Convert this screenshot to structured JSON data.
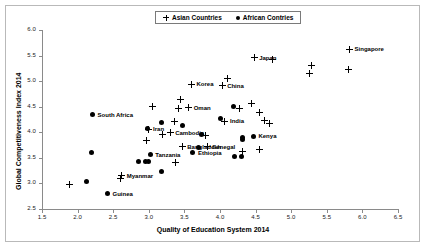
{
  "chart_data": {
    "type": "scatter",
    "title": "",
    "xlabel": "Quality of Education System 2014",
    "ylabel": "Global Competitiveness Index 2014",
    "xlim": [
      1.5,
      6.5
    ],
    "ylim": [
      2.5,
      6.0
    ],
    "xticks": [
      "1.5",
      "2.0",
      "2.5",
      "3.0",
      "3.5",
      "4.0",
      "4.5",
      "5.0",
      "5.5",
      "6.0",
      "6.5"
    ],
    "yticks": [
      "2.5",
      "3.0",
      "3.5",
      "4.0",
      "4.5",
      "5.0",
      "5.5",
      "6.0"
    ],
    "grid": false,
    "legend_position": "top-center",
    "legend": [
      {
        "label": "Asian Countries",
        "marker": "plus"
      },
      {
        "label": "African Contries",
        "marker": "dot"
      }
    ],
    "series": [
      {
        "name": "Asian Countries",
        "marker": "plus",
        "points": [
          {
            "x": 1.89,
            "y": 2.97,
            "label": ""
          },
          {
            "x": 2.6,
            "y": 3.09,
            "label": ""
          },
          {
            "x": 2.62,
            "y": 3.15,
            "label": "Myanmar",
            "label_side": "right"
          },
          {
            "x": 2.97,
            "y": 3.83,
            "label": ""
          },
          {
            "x": 2.99,
            "y": 4.06,
            "label": "Iran",
            "label_side": "right"
          },
          {
            "x": 3.05,
            "y": 4.51,
            "label": ""
          },
          {
            "x": 3.19,
            "y": 3.96,
            "label": ""
          },
          {
            "x": 3.3,
            "y": 3.99,
            "label": "Cambodia",
            "label_side": "right"
          },
          {
            "x": 3.36,
            "y": 4.22,
            "label": ""
          },
          {
            "x": 3.38,
            "y": 3.41,
            "label": ""
          },
          {
            "x": 3.42,
            "y": 4.47,
            "label": ""
          },
          {
            "x": 3.44,
            "y": 4.65,
            "label": ""
          },
          {
            "x": 3.47,
            "y": 3.72,
            "label": "Bangladesh",
            "label_side": "right"
          },
          {
            "x": 3.56,
            "y": 4.48,
            "label": "Oman",
            "label_side": "right"
          },
          {
            "x": 3.6,
            "y": 4.94,
            "label": "Korea",
            "label_side": "right"
          },
          {
            "x": 3.8,
            "y": 3.94,
            "label": ""
          },
          {
            "x": 3.82,
            "y": 3.72,
            "label": "Senegal",
            "label_side": "right"
          },
          {
            "x": 4.03,
            "y": 4.91,
            "label": "China",
            "label_side": "right"
          },
          {
            "x": 4.07,
            "y": 4.22,
            "label": "India",
            "label_side": "right"
          },
          {
            "x": 4.1,
            "y": 5.06,
            "label": ""
          },
          {
            "x": 4.28,
            "y": 4.46,
            "label": ""
          },
          {
            "x": 4.32,
            "y": 3.62,
            "label": ""
          },
          {
            "x": 4.44,
            "y": 4.57,
            "label": ""
          },
          {
            "x": 4.48,
            "y": 5.46,
            "label": "Japan",
            "label_side": "right"
          },
          {
            "x": 4.55,
            "y": 4.39,
            "label": ""
          },
          {
            "x": 4.56,
            "y": 3.67,
            "label": ""
          },
          {
            "x": 4.62,
            "y": 4.24,
            "label": ""
          },
          {
            "x": 4.7,
            "y": 4.18,
            "label": ""
          },
          {
            "x": 4.74,
            "y": 5.43,
            "label": ""
          },
          {
            "x": 5.26,
            "y": 5.15,
            "label": ""
          },
          {
            "x": 5.28,
            "y": 5.31,
            "label": ""
          },
          {
            "x": 5.8,
            "y": 5.23,
            "label": ""
          },
          {
            "x": 5.82,
            "y": 5.62,
            "label": "Singapore",
            "label_side": "right"
          }
        ]
      },
      {
        "name": "African Contries",
        "marker": "dot",
        "points": [
          {
            "x": 2.13,
            "y": 3.04,
            "label": ""
          },
          {
            "x": 2.19,
            "y": 3.6,
            "label": ""
          },
          {
            "x": 2.21,
            "y": 4.34,
            "label": "South Africa",
            "label_side": "right"
          },
          {
            "x": 2.42,
            "y": 2.8,
            "label": "Guinea",
            "label_side": "right"
          },
          {
            "x": 2.85,
            "y": 3.43,
            "label": ""
          },
          {
            "x": 2.96,
            "y": 3.42,
            "label": ""
          },
          {
            "x": 2.99,
            "y": 3.42,
            "label": ""
          },
          {
            "x": 2.98,
            "y": 4.07,
            "label": ""
          },
          {
            "x": 3.02,
            "y": 3.56,
            "label": "Tanzania",
            "label_side": "right"
          },
          {
            "x": 3.18,
            "y": 4.2,
            "label": ""
          },
          {
            "x": 3.18,
            "y": 3.24,
            "label": ""
          },
          {
            "x": 3.47,
            "y": 4.13,
            "label": ""
          },
          {
            "x": 3.62,
            "y": 3.6,
            "label": "Ethiopia",
            "label_side": "right"
          },
          {
            "x": 3.7,
            "y": 3.7,
            "label": ""
          },
          {
            "x": 3.74,
            "y": 3.95,
            "label": ""
          },
          {
            "x": 4.01,
            "y": 4.26,
            "label": ""
          },
          {
            "x": 4.19,
            "y": 4.5,
            "label": ""
          },
          {
            "x": 4.21,
            "y": 3.52,
            "label": ""
          },
          {
            "x": 4.3,
            "y": 3.52,
            "label": ""
          },
          {
            "x": 4.31,
            "y": 3.9,
            "label": ""
          },
          {
            "x": 4.32,
            "y": 3.86,
            "label": ""
          },
          {
            "x": 4.47,
            "y": 3.92,
            "label": "Kenya",
            "label_side": "right"
          }
        ]
      }
    ]
  }
}
